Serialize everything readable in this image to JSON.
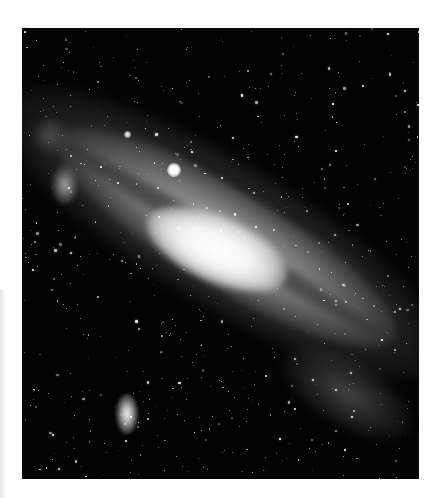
{
  "image": {
    "subject": "Spiral galaxy (Andromeda-like) with satellite galaxy on dark star field",
    "palette": {
      "background": "#ffffff",
      "sky": "#030303",
      "core": "#ffffff",
      "disk": "#a0a0a0",
      "dust": "#1e1e1e",
      "star": "#ffffff"
    },
    "frame": {
      "left": 22,
      "top": 28,
      "width": 397,
      "height": 451
    }
  },
  "starfield": {
    "count": 650,
    "seed": 20231,
    "min_size": 0.8,
    "max_size": 2.6,
    "min_opacity": 0.25,
    "max_opacity": 1.0
  }
}
